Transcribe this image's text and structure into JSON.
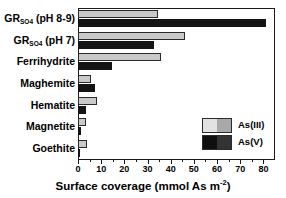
{
  "chart_data": {
    "type": "bar",
    "orientation": "horizontal",
    "title": "",
    "xlabel": "Surface coverage (mmol As m⁻²)",
    "ylabel": "",
    "xlim": [
      0,
      85
    ],
    "xticks": [
      0,
      10,
      20,
      30,
      40,
      50,
      60,
      70,
      80
    ],
    "xtick_labels": [
      "0",
      "10",
      "20",
      "30",
      "40",
      "50",
      "60",
      "70",
      "80"
    ],
    "grid": false,
    "legend_position": "lower right",
    "categories": [
      "GR_SO4 (pH 8-9)",
      "GR_SO4 (pH 7)",
      "Ferrihydrite",
      "Maghemite",
      "Hematite",
      "Magnetite",
      "Goethite"
    ],
    "category_labels": [
      {
        "base": "GR",
        "sub": "SO4",
        "suffix": " (pH 8-9)"
      },
      {
        "base": "GR",
        "sub": "SO4",
        "suffix": " (pH 7)"
      },
      {
        "base": "Ferrihydrite",
        "sub": "",
        "suffix": ""
      },
      {
        "base": "Maghemite",
        "sub": "",
        "suffix": ""
      },
      {
        "base": "Hematite",
        "sub": "",
        "suffix": ""
      },
      {
        "base": "Magnetite",
        "sub": "",
        "suffix": ""
      },
      {
        "base": "Goethite",
        "sub": "",
        "suffix": ""
      }
    ],
    "series": [
      {
        "name": "As(III)",
        "color": "#c9c9c9",
        "values": [
          34.5,
          46.0,
          36.0,
          5.5,
          8.0,
          3.5,
          4.0
        ]
      },
      {
        "name": "As(V)",
        "color": "#141414",
        "values": [
          81.0,
          33.0,
          14.5,
          7.5,
          3.5,
          1.2,
          0.6
        ]
      }
    ]
  },
  "legend": {
    "entries": [
      {
        "label": "As(III)"
      },
      {
        "label": "As(V)"
      }
    ]
  },
  "axis": {
    "x_title": "Surface coverage (mmol As m",
    "x_title_exponent": "-2",
    "x_title_close": ")"
  }
}
